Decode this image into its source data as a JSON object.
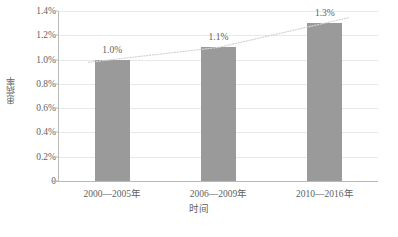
{
  "chart_data": {
    "type": "bar",
    "title": "",
    "subtitle": "",
    "xlabel": "时间",
    "ylabel": "患病率",
    "categories": [
      "2000—2005年",
      "2006—2009年",
      "2010—2016年"
    ],
    "values": [
      1.0,
      1.1,
      1.3
    ],
    "value_labels": [
      "1.0%",
      "1.1%",
      "1.3%"
    ],
    "ylim": [
      0,
      1.4
    ],
    "ytick_values": [
      0,
      0.2,
      0.4,
      0.6,
      0.8,
      1.0,
      1.2,
      1.4
    ],
    "ytick_labels": [
      "0",
      "0.2%",
      "0.4%",
      "0.6%",
      "0.8%",
      "1.0%",
      "1.2%",
      "1.4%"
    ],
    "grid": true,
    "legend": false,
    "legend_position": "none",
    "series": [
      {
        "name": "患病率",
        "type": "bar",
        "values": [
          1.0,
          1.1,
          1.3
        ],
        "color": "#9a9a9a"
      },
      {
        "name": "趋势线",
        "type": "line",
        "style": "dotted",
        "values": [
          1.0,
          1.1,
          1.3
        ],
        "color": "#d5d5d5"
      }
    ],
    "annotations": []
  },
  "colors": {
    "bar": "#9a9a9a",
    "trend_line": "#d5d5d5",
    "gridline": "#e8e8e8",
    "axis": "#b9b9b9",
    "text": "#5f5f5f",
    "background": "#ffffff"
  },
  "caption": ""
}
